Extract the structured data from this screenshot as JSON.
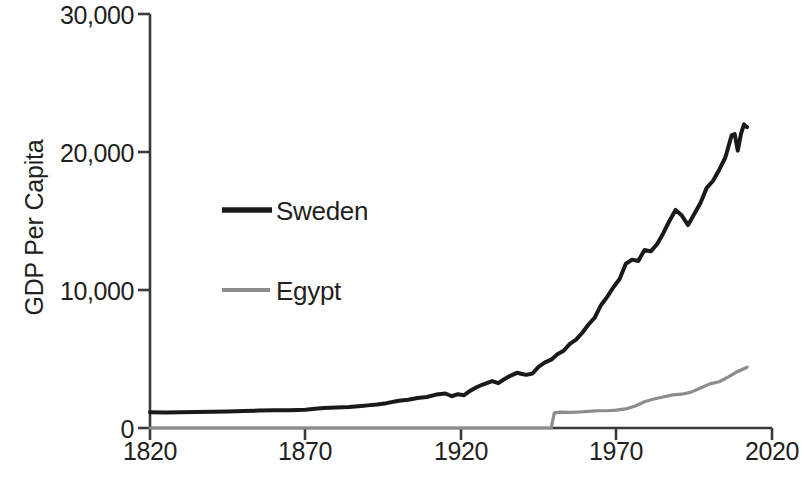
{
  "chart_data": {
    "type": "line",
    "title": "",
    "xlabel": "",
    "ylabel": "GDP Per Capita",
    "xlim": [
      1820,
      2020
    ],
    "ylim": [
      0,
      30000
    ],
    "grid": false,
    "legend_position": "inside-left",
    "x_ticks": [
      "1820",
      "1870",
      "1920",
      "1970",
      "2020"
    ],
    "x_tick_values": [
      1820,
      1870,
      1920,
      1970,
      2020
    ],
    "y_ticks": [
      "0",
      "10,000",
      "20,000",
      "30,000"
    ],
    "y_tick_values": [
      0,
      10000,
      20000,
      30000
    ],
    "series": [
      {
        "name": "Sweden",
        "color": "#1a1a1a",
        "width": 4.0,
        "x": [
          1820,
          1825,
          1830,
          1835,
          1840,
          1845,
          1850,
          1855,
          1860,
          1865,
          1870,
          1873,
          1876,
          1880,
          1884,
          1888,
          1890,
          1893,
          1896,
          1900,
          1903,
          1906,
          1909,
          1912,
          1915,
          1917,
          1919,
          1921,
          1923,
          1925,
          1927,
          1930,
          1932,
          1934,
          1936,
          1938,
          1940,
          1941,
          1943,
          1945,
          1947,
          1949,
          1951,
          1953,
          1955,
          1957,
          1959,
          1961,
          1963,
          1965,
          1967,
          1969,
          1971,
          1973,
          1975,
          1977,
          1979,
          1981,
          1983,
          1985,
          1987,
          1989,
          1991,
          1993,
          1995,
          1997,
          1999,
          2001,
          2003,
          2005,
          2007,
          2008,
          2009,
          2010,
          2011,
          2012
        ],
        "y": [
          1150,
          1130,
          1150,
          1160,
          1180,
          1200,
          1230,
          1260,
          1280,
          1290,
          1330,
          1400,
          1450,
          1480,
          1520,
          1600,
          1640,
          1700,
          1800,
          1980,
          2050,
          2180,
          2250,
          2420,
          2500,
          2300,
          2450,
          2380,
          2700,
          2950,
          3150,
          3400,
          3250,
          3550,
          3800,
          4000,
          3900,
          3850,
          3950,
          4450,
          4750,
          4950,
          5350,
          5600,
          6100,
          6400,
          6900,
          7500,
          8000,
          8900,
          9500,
          10200,
          10800,
          11900,
          12200,
          12100,
          12900,
          12800,
          13300,
          14100,
          15000,
          15800,
          15400,
          14700,
          15500,
          16300,
          17400,
          17900,
          18700,
          19600,
          21200,
          21300,
          20100,
          21300,
          22000,
          21800
        ],
        "start_value": 1150,
        "peak_value": 25300,
        "peak_year": 2008,
        "end_value": 24200
      },
      {
        "name": "Egypt",
        "color": "#8c8c8c",
        "width": 3.2,
        "x": [
          1820,
          1870,
          1920,
          1945,
          1949,
          1950,
          1952,
          1955,
          1958,
          1961,
          1964,
          1967,
          1970,
          1973,
          1976,
          1979,
          1982,
          1985,
          1988,
          1991,
          1994,
          1997,
          2000,
          2003,
          2006,
          2009,
          2012
        ],
        "y": [
          0,
          0,
          0,
          0,
          0,
          1100,
          1150,
          1130,
          1160,
          1200,
          1250,
          1250,
          1300,
          1380,
          1600,
          1900,
          2100,
          2250,
          2400,
          2450,
          2600,
          2900,
          3200,
          3350,
          3700,
          4100,
          4400
        ],
        "start_year": 1950,
        "start_value": 1100,
        "end_value": 4400
      }
    ]
  },
  "legend": {
    "items": [
      {
        "label": "Sweden",
        "color": "#1a1a1a"
      },
      {
        "label": "Egypt",
        "color": "#8c8c8c"
      }
    ]
  },
  "axis": {
    "y_title": "GDP Per Capita",
    "y_tick_0": "0",
    "y_tick_1": "10,000",
    "y_tick_2": "20,000",
    "y_tick_3": "30,000",
    "x_tick_0": "1820",
    "x_tick_1": "1870",
    "x_tick_2": "1920",
    "x_tick_3": "1970",
    "x_tick_4": "2020"
  }
}
